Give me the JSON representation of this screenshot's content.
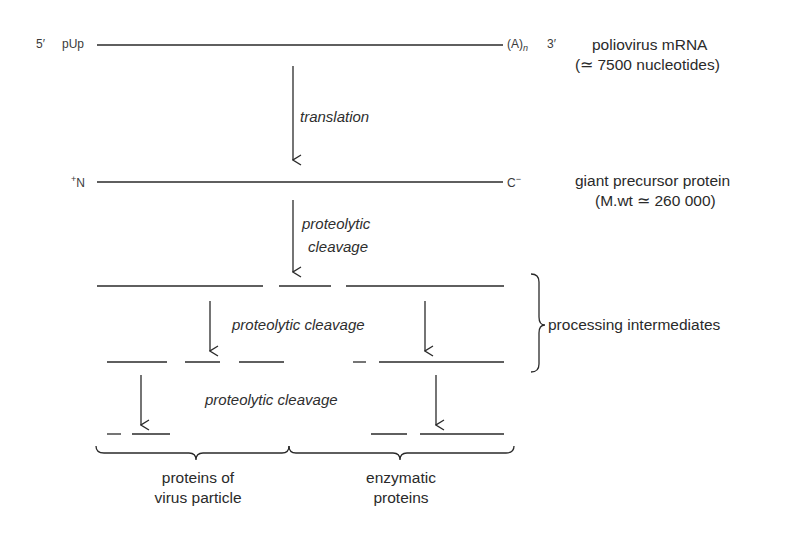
{
  "mrna": {
    "five_prime": "5′",
    "cap": "pUp",
    "polyA": "(A)",
    "polyA_sub": "n",
    "three_prime": "3′",
    "label_line1": "poliovirus mRNA",
    "label_line2": "(≃ 7500 nucleotides)"
  },
  "step1": {
    "label": "translation"
  },
  "precursor": {
    "n_term_sup": "+",
    "n_term": "N",
    "c_term": "C",
    "c_term_sup": "−",
    "label_line1": "giant precursor protein",
    "label_line2": "(M.wt ≃ 260 000)"
  },
  "step2": {
    "line1": "proteolytic",
    "line2": "cleavage"
  },
  "step3": {
    "label": "proteolytic cleavage"
  },
  "step4": {
    "label": "proteolytic cleavage"
  },
  "intermediates": {
    "label": "processing intermediates"
  },
  "products": {
    "virus_line1": "proteins of",
    "virus_line2": "virus particle",
    "enzymatic_line1": "enzymatic",
    "enzymatic_line2": "proteins"
  },
  "colors": {
    "line": "#2a2a2a",
    "text": "#2a2a2a",
    "background": "#ffffff"
  },
  "segments": {
    "mrna": [
      [
        97,
        503
      ]
    ],
    "precursor": [
      [
        97,
        503
      ]
    ],
    "row1": [
      [
        97,
        263
      ],
      [
        279,
        331
      ],
      [
        346,
        504
      ]
    ],
    "row2": [
      [
        107,
        167
      ],
      [
        185,
        220
      ],
      [
        239,
        284
      ],
      [
        353,
        366
      ],
      [
        379,
        504
      ]
    ],
    "row3": [
      [
        107,
        121
      ],
      [
        132,
        170
      ],
      [
        371,
        407
      ],
      [
        420,
        504
      ]
    ]
  }
}
